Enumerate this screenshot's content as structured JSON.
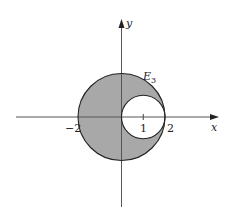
{
  "diagram": {
    "type": "region-plot",
    "axes": {
      "x_label": "x",
      "y_label": "y",
      "tick_labels": {
        "neg2": "−2",
        "one": "1",
        "two": "2"
      }
    },
    "region": {
      "label_main": "E",
      "label_sub": "3",
      "description": "Disk of radius 2 centered at origin minus disk of radius 1 centered at (1,0)",
      "fill_color": "#a8a8a8",
      "outer_circle": {
        "cx": 0,
        "cy": 0,
        "r": 2
      },
      "inner_circle": {
        "cx": 1,
        "cy": 0,
        "r": 1
      }
    },
    "colors": {
      "axis": "#555555",
      "outline": "#222222",
      "background": "#ffffff"
    }
  }
}
